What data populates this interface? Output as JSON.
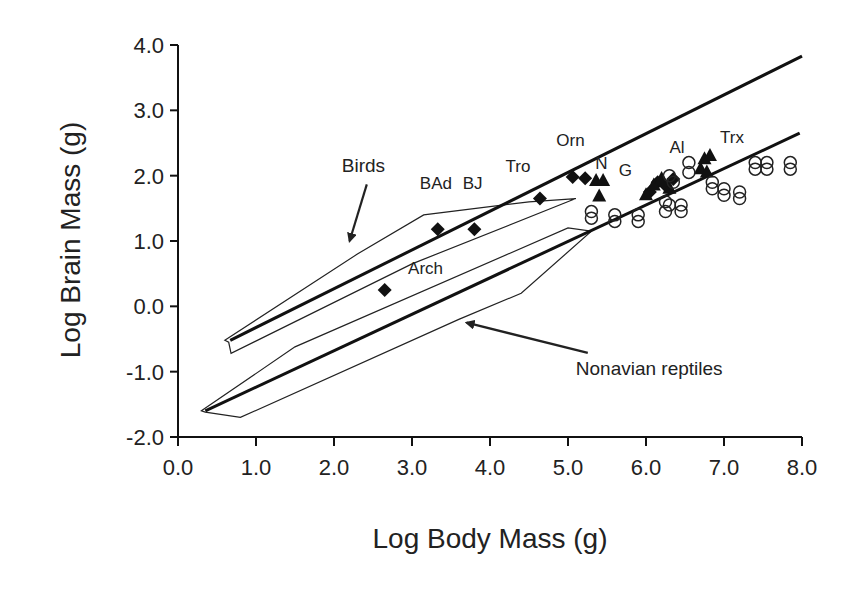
{
  "chart_data": {
    "type": "scatter",
    "title": "",
    "xlabel": "Log Body Mass (g)",
    "ylabel": "Log Brain Mass (g)",
    "xlim": [
      0.0,
      8.0
    ],
    "ylim": [
      -2.0,
      4.0
    ],
    "x_ticks": [
      "0.0",
      "1.0",
      "2.0",
      "3.0",
      "4.0",
      "5.0",
      "6.0",
      "7.0",
      "8.0"
    ],
    "y_ticks": [
      "-2.0",
      "-1.0",
      "0.0",
      "1.0",
      "2.0",
      "3.0",
      "4.0"
    ],
    "grid": false,
    "legend": null,
    "annotations": [
      {
        "text": "Birds",
        "x": 2.1,
        "y": 2.05,
        "arrow_to": [
          2.2,
          1.0
        ]
      },
      {
        "text": "Nonavian reptiles",
        "x": 5.1,
        "y": -1.05,
        "arrow_to": [
          3.7,
          -0.25
        ]
      },
      {
        "text": "BAd",
        "x": 3.1,
        "y": 1.8
      },
      {
        "text": "BJ",
        "x": 3.65,
        "y": 1.8
      },
      {
        "text": "Tro",
        "x": 4.2,
        "y": 2.05
      },
      {
        "text": "Orn",
        "x": 4.85,
        "y": 2.45
      },
      {
        "text": "N",
        "x": 5.35,
        "y": 2.1
      },
      {
        "text": "G",
        "x": 5.65,
        "y": 2.0
      },
      {
        "text": "Al",
        "x": 6.3,
        "y": 2.35
      },
      {
        "text": "Trx",
        "x": 6.95,
        "y": 2.5
      },
      {
        "text": "Arch",
        "x": 2.95,
        "y": 0.5
      }
    ],
    "series": [
      {
        "name": "Birds regression line",
        "kind": "line",
        "points": [
          [
            0.67,
            -0.52
          ],
          [
            8.0,
            3.83
          ]
        ]
      },
      {
        "name": "Nonavian reptiles regression line",
        "kind": "line",
        "points": [
          [
            0.35,
            -1.6
          ],
          [
            7.97,
            2.65
          ]
        ]
      },
      {
        "name": "Birds polygon",
        "kind": "polygon",
        "points": [
          [
            0.6,
            -0.52
          ],
          [
            2.3,
            0.8
          ],
          [
            3.15,
            1.4
          ],
          [
            4.5,
            1.6
          ],
          [
            5.1,
            1.65
          ],
          [
            3.0,
            0.65
          ],
          [
            0.68,
            -0.72
          ],
          [
            0.65,
            -0.55
          ]
        ]
      },
      {
        "name": "Nonavian reptiles polygon",
        "kind": "polygon",
        "points": [
          [
            0.3,
            -1.6
          ],
          [
            1.5,
            -0.62
          ],
          [
            5.0,
            1.2
          ],
          [
            5.3,
            1.15
          ],
          [
            4.4,
            0.2
          ],
          [
            3.6,
            -0.2
          ],
          [
            0.8,
            -1.7
          ],
          [
            0.35,
            -1.62
          ]
        ]
      },
      {
        "name": "Archosaurs / birds (diamonds)",
        "kind": "scatter",
        "marker": "diamond",
        "labels": [
          "Arch",
          "BAd",
          "BJ",
          "Tro",
          "Orn",
          "Orn",
          "G",
          "G",
          "Al",
          "Al"
        ],
        "points": [
          [
            2.65,
            0.25
          ],
          [
            3.33,
            1.18
          ],
          [
            3.8,
            1.18
          ],
          [
            4.64,
            1.65
          ],
          [
            5.06,
            1.98
          ],
          [
            5.22,
            1.96
          ],
          [
            6.05,
            1.75
          ],
          [
            6.15,
            1.9
          ],
          [
            6.35,
            1.95
          ],
          [
            6.25,
            1.85
          ]
        ]
      },
      {
        "name": "Nonavian theropods (triangles)",
        "kind": "scatter",
        "marker": "triangle",
        "labels": [
          "N",
          "N",
          "N",
          "G",
          "G",
          "Al",
          "Al",
          "Trx",
          "Trx",
          "Trx",
          "Trx"
        ],
        "points": [
          [
            5.36,
            1.92
          ],
          [
            5.45,
            1.92
          ],
          [
            5.4,
            1.68
          ],
          [
            6.0,
            1.7
          ],
          [
            6.1,
            1.85
          ],
          [
            6.2,
            1.95
          ],
          [
            6.3,
            1.8
          ],
          [
            6.7,
            2.1
          ],
          [
            6.75,
            2.25
          ],
          [
            6.82,
            2.3
          ],
          [
            6.78,
            2.05
          ]
        ]
      },
      {
        "name": "Nonavian reptiles (open circles)",
        "kind": "scatter",
        "marker": "circle-open",
        "points": [
          [
            5.3,
            1.45
          ],
          [
            5.3,
            1.35
          ],
          [
            5.6,
            1.4
          ],
          [
            5.6,
            1.3
          ],
          [
            5.9,
            1.4
          ],
          [
            5.9,
            1.3
          ],
          [
            6.25,
            1.6
          ],
          [
            6.25,
            1.45
          ],
          [
            6.3,
            1.55
          ],
          [
            6.45,
            1.55
          ],
          [
            6.45,
            1.45
          ],
          [
            6.3,
            2.0
          ],
          [
            6.35,
            1.9
          ],
          [
            6.55,
            2.2
          ],
          [
            6.55,
            2.05
          ],
          [
            6.85,
            1.9
          ],
          [
            6.85,
            1.8
          ],
          [
            7.0,
            1.8
          ],
          [
            7.0,
            1.7
          ],
          [
            7.2,
            1.75
          ],
          [
            7.2,
            1.65
          ],
          [
            7.4,
            2.2
          ],
          [
            7.4,
            2.1
          ],
          [
            7.55,
            2.2
          ],
          [
            7.55,
            2.1
          ],
          [
            7.85,
            2.2
          ],
          [
            7.85,
            2.1
          ]
        ]
      }
    ]
  }
}
